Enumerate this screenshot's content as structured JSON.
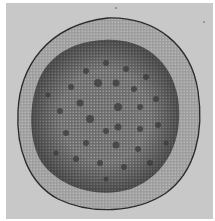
{
  "image": {
    "subject": "stem cross-section micrograph",
    "background_color": "#c8c8c8",
    "border_color": "#ffffff",
    "cortex_color": "#a9a9a9",
    "stele_color": "#6f6f6f",
    "bundle_color": "#3a3a3a",
    "epidermis_color": "#2a2a2a"
  }
}
